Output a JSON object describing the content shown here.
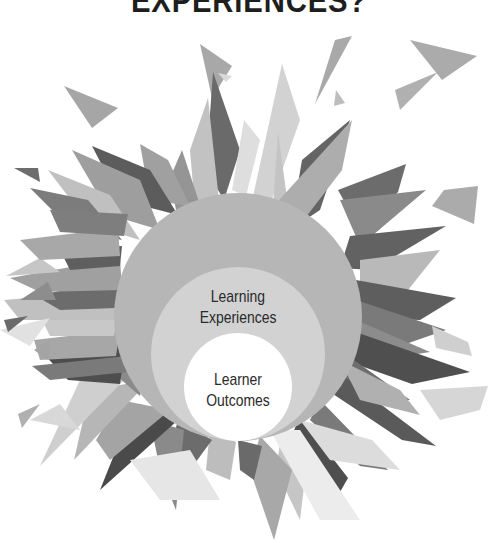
{
  "title": "EXPERIENCES?",
  "diagram": {
    "type": "nested-circles-with-burst",
    "circles": [
      {
        "id": "outer",
        "label": "",
        "fill": "#b6b6b6"
      },
      {
        "id": "middle",
        "label_line1": "Learning",
        "label_line2": "Experiences",
        "fill": "#d2d2d2"
      },
      {
        "id": "inner",
        "label_line1": "Learner",
        "label_line2": "Outcomes",
        "fill": "#ffffff"
      }
    ],
    "shard_colors": [
      "#5a5a5a",
      "#7a7a7a",
      "#9a9a9a",
      "#b4b4b4",
      "#cccccc",
      "#e2e2e2"
    ]
  }
}
